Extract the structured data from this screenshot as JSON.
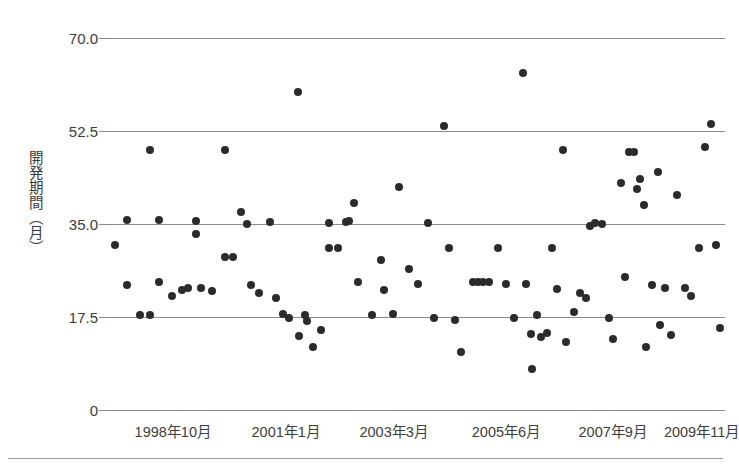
{
  "chart_data": {
    "type": "scatter",
    "title": "",
    "xlabel": "",
    "ylabel": "開発期間（月）",
    "ylim": [
      0,
      70
    ],
    "yticks": [
      "0",
      "17.5",
      "35.0",
      "52.5",
      "70.0"
    ],
    "ytick_values": [
      0,
      17.5,
      35.0,
      52.5,
      70.0
    ],
    "xtick_labels": [
      "1998年10月",
      "2001年1月",
      "2003年3月",
      "2005年6月",
      "2007年9月",
      "2009年11月"
    ],
    "xtick_positions": [
      0.105,
      0.288,
      0.463,
      0.645,
      0.818,
      0.962
    ],
    "grid": true,
    "legend": null,
    "marker_color": "#2b2b2b",
    "grid_color": "#8c8c8c",
    "points": [
      [
        0.012,
        31.0
      ],
      [
        0.03,
        35.8
      ],
      [
        0.03,
        23.5
      ],
      [
        0.052,
        17.8
      ],
      [
        0.068,
        48.9
      ],
      [
        0.068,
        17.8
      ],
      [
        0.082,
        35.8
      ],
      [
        0.082,
        24.0
      ],
      [
        0.103,
        21.5
      ],
      [
        0.12,
        22.5
      ],
      [
        0.13,
        23.0
      ],
      [
        0.142,
        35.5
      ],
      [
        0.142,
        33.2
      ],
      [
        0.15,
        23.0
      ],
      [
        0.168,
        22.3
      ],
      [
        0.19,
        48.9
      ],
      [
        0.19,
        28.8
      ],
      [
        0.203,
        28.8
      ],
      [
        0.215,
        37.2
      ],
      [
        0.225,
        35.0
      ],
      [
        0.232,
        23.5
      ],
      [
        0.245,
        22.0
      ],
      [
        0.262,
        35.3
      ],
      [
        0.272,
        21.0
      ],
      [
        0.283,
        18.0
      ],
      [
        0.293,
        17.3
      ],
      [
        0.308,
        59.8
      ],
      [
        0.31,
        14.0
      ],
      [
        0.32,
        17.8
      ],
      [
        0.322,
        16.8
      ],
      [
        0.333,
        11.8
      ],
      [
        0.345,
        15.0
      ],
      [
        0.358,
        35.2
      ],
      [
        0.358,
        30.5
      ],
      [
        0.372,
        30.5
      ],
      [
        0.385,
        35.3
      ],
      [
        0.39,
        35.5
      ],
      [
        0.398,
        39.0
      ],
      [
        0.405,
        24.0
      ],
      [
        0.428,
        17.8
      ],
      [
        0.442,
        28.3
      ],
      [
        0.448,
        22.5
      ],
      [
        0.462,
        18.0
      ],
      [
        0.472,
        42.0
      ],
      [
        0.488,
        26.5
      ],
      [
        0.502,
        23.8
      ],
      [
        0.518,
        35.2
      ],
      [
        0.528,
        17.3
      ],
      [
        0.545,
        53.5
      ],
      [
        0.552,
        30.5
      ],
      [
        0.562,
        17.0
      ],
      [
        0.572,
        11.0
      ],
      [
        0.592,
        24.0
      ],
      [
        0.6,
        24.0
      ],
      [
        0.608,
        24.0
      ],
      [
        0.618,
        24.0
      ],
      [
        0.632,
        30.5
      ],
      [
        0.645,
        23.8
      ],
      [
        0.658,
        17.3
      ],
      [
        0.672,
        63.5
      ],
      [
        0.678,
        23.8
      ],
      [
        0.685,
        14.3
      ],
      [
        0.688,
        7.8
      ],
      [
        0.695,
        17.8
      ],
      [
        0.702,
        13.8
      ],
      [
        0.712,
        14.5
      ],
      [
        0.72,
        30.5
      ],
      [
        0.728,
        22.8
      ],
      [
        0.738,
        49.0
      ],
      [
        0.742,
        12.8
      ],
      [
        0.755,
        18.5
      ],
      [
        0.765,
        22.0
      ],
      [
        0.775,
        21.0
      ],
      [
        0.782,
        34.7
      ],
      [
        0.79,
        35.2
      ],
      [
        0.8,
        35.0
      ],
      [
        0.812,
        17.3
      ],
      [
        0.818,
        13.3
      ],
      [
        0.832,
        42.8
      ],
      [
        0.838,
        25.0
      ],
      [
        0.845,
        48.5
      ],
      [
        0.852,
        48.5
      ],
      [
        0.858,
        41.5
      ],
      [
        0.862,
        43.5
      ],
      [
        0.868,
        38.5
      ],
      [
        0.872,
        11.8
      ],
      [
        0.882,
        23.5
      ],
      [
        0.892,
        44.8
      ],
      [
        0.895,
        16.0
      ],
      [
        0.902,
        23.0
      ],
      [
        0.912,
        14.2
      ],
      [
        0.922,
        40.5
      ],
      [
        0.935,
        23.0
      ],
      [
        0.945,
        21.5
      ],
      [
        0.958,
        30.5
      ],
      [
        0.968,
        49.5
      ],
      [
        0.978,
        53.8
      ],
      [
        0.985,
        31.0
      ],
      [
        0.992,
        15.5
      ]
    ]
  }
}
